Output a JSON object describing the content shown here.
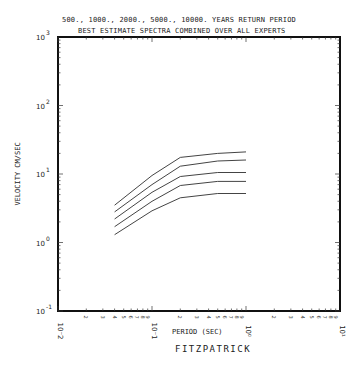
{
  "header": {
    "line1": "500., 1000., 2000.,  5000.,  10000. YEARS RETURN PERIOD",
    "line2": "BEST ESTIMATE SPECTRA COMBINED OVER ALL EXPERTS"
  },
  "footer": {
    "label": "FITZPATRICK"
  },
  "chart_data": {
    "type": "line",
    "title": "BEST ESTIMATE SPECTRA COMBINED OVER ALL EXPERTS",
    "subtitle": "500., 1000., 2000., 5000., 10000. YEARS RETURN PERIOD",
    "xlabel": "PERIOD (SEC)",
    "ylabel": "VELOCITY CM/SEC",
    "xscale": "log",
    "yscale": "log",
    "xlim": [
      0.01,
      10
    ],
    "ylim": [
      0.1,
      1000
    ],
    "xticks": [
      "10^-2",
      "10^-1",
      "10^0",
      "10^1"
    ],
    "yticks": [
      "10^-1",
      "10^0",
      "10^1",
      "10^2",
      "10^3"
    ],
    "minor_tick_labels": [
      "2",
      "3",
      "4",
      "5",
      "6",
      "7",
      "8",
      "9"
    ],
    "grid": false,
    "legend": "none",
    "annotation": "FITZPATRICK",
    "x": [
      0.04,
      0.1,
      0.2,
      0.5,
      1.0
    ],
    "series": [
      {
        "name": "10000 yr",
        "values": [
          3.5,
          9.5,
          17.5,
          20,
          21
        ]
      },
      {
        "name": "5000 yr",
        "values": [
          2.8,
          7.0,
          13,
          15.5,
          16
        ]
      },
      {
        "name": "2000 yr",
        "values": [
          2.2,
          5.4,
          9.2,
          10.5,
          10.5
        ]
      },
      {
        "name": "1000 yr",
        "values": [
          1.7,
          4.0,
          6.8,
          7.8,
          7.8
        ]
      },
      {
        "name": "500 yr",
        "values": [
          1.3,
          2.9,
          4.5,
          5.2,
          5.2
        ]
      }
    ]
  }
}
